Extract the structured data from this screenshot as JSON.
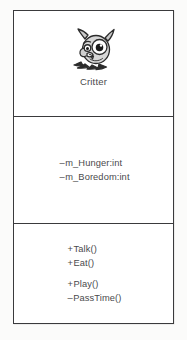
{
  "diagram": {
    "type": "uml-class-diagram",
    "background_color": "#fbfbfa",
    "class": {
      "name": "Critter",
      "icon": "critter-monster-icon",
      "border_color": "#3a3a3c",
      "fill_color": "#ffffff",
      "text_color": "#4a4a4c",
      "icon_colors": {
        "body": "#d6d6d6",
        "outline": "#2b2b2b",
        "eye_white": "#ffffff",
        "pupil": "#1a1a1a",
        "highlight": "#f2f2f2"
      },
      "attributes": [
        {
          "visibility": "–",
          "visibility_name": "private",
          "signature": "m_Hunger:int"
        },
        {
          "visibility": "–",
          "visibility_name": "private",
          "signature": "m_Boredom:int"
        }
      ],
      "operations": [
        {
          "visibility": "+",
          "visibility_name": "public",
          "signature": "Talk()"
        },
        {
          "visibility": "+",
          "visibility_name": "public",
          "signature": "Eat()"
        },
        {
          "visibility": "+",
          "visibility_name": "public",
          "signature": "Play()"
        },
        {
          "visibility": "–",
          "visibility_name": "private",
          "signature": "PassTime()"
        }
      ]
    }
  }
}
